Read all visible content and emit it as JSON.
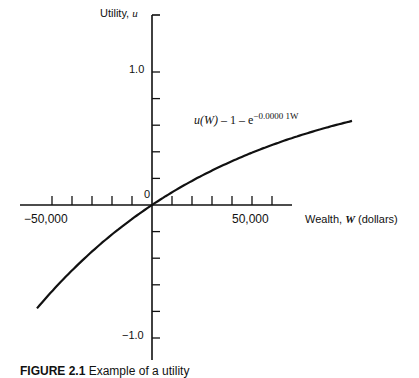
{
  "chart_data": {
    "type": "line",
    "title": "",
    "xlabel": "Wealth, W (dollars)",
    "ylabel": "Utility, u",
    "xlim": [
      -65000,
      70000
    ],
    "ylim": [
      -1.2,
      1.4
    ],
    "x_ticks_step": 10000,
    "y_ticks_step": 0.2,
    "x_tick_labels": [
      "-50,000",
      "50,000"
    ],
    "y_tick_labels": [
      "1.0",
      "0",
      "-1.0"
    ],
    "grid": false,
    "legend": null,
    "annotation": "u(W) = 1 - e^(-0.00001W)",
    "series": [
      {
        "name": "u(W) = 1 - e^(-0.00001W)",
        "x": [
          -57500,
          -50000,
          -40000,
          -30000,
          -20000,
          -10000,
          0,
          10000,
          20000,
          30000,
          40000,
          50000,
          60000,
          70000,
          80000,
          90000,
          100000
        ],
        "y": [
          -0.777,
          -0.649,
          -0.492,
          -0.35,
          -0.221,
          -0.105,
          0.0,
          0.095,
          0.181,
          0.259,
          0.33,
          0.393,
          0.451,
          0.503,
          0.551,
          0.593,
          0.632
        ]
      }
    ]
  },
  "labels": {
    "y_axis_title": "Utility, ",
    "y_axis_var": "u",
    "y_one": "1.0",
    "y_zero": "0",
    "y_neg_one": "−1.0",
    "x_neg": "−50,000",
    "x_pos": "50,000",
    "x_axis_title": "Wealth, ",
    "x_axis_var": "W",
    "x_axis_unit": " (dollars)",
    "formula_lhs": "u(W)",
    "formula_mid": " – 1 – e",
    "formula_exp": "−0.0000 1W"
  },
  "caption": {
    "prefix": "FIGURE 2.1",
    "text": "  Example of a utility"
  }
}
